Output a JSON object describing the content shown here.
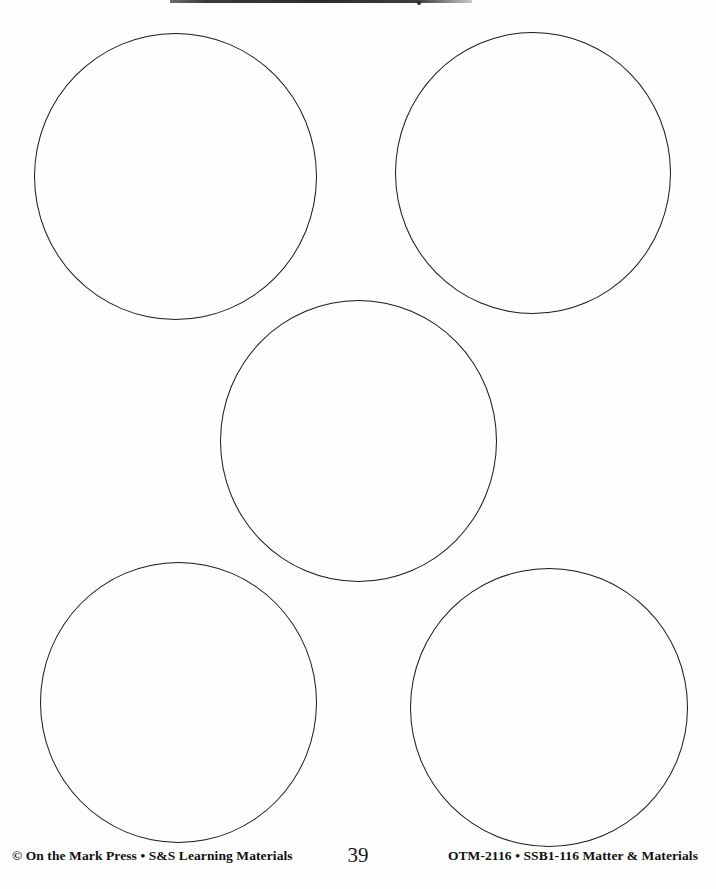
{
  "page": {
    "width": 716,
    "height": 889,
    "background_color": "#fefefe",
    "ink_color": "#1a1a1a",
    "document_type": "blank-worksheet"
  },
  "artifacts": {
    "top_scan_bar": {
      "name": "scan-edge-bar",
      "x": 170,
      "y": 0,
      "width": 302,
      "height": 3,
      "color": "#2c2c2c"
    }
  },
  "shapes": {
    "kind": "circle-outline",
    "stroke_color": "#1a1a1a",
    "stroke_width": 1.6,
    "fill": "none",
    "count": 5,
    "circles": [
      {
        "id": "circle-top-left",
        "label": "1",
        "x": 34,
        "y": 33,
        "width": 283,
        "height": 287
      },
      {
        "id": "circle-top-right",
        "label": "2",
        "x": 395,
        "y": 32,
        "width": 276,
        "height": 282
      },
      {
        "id": "circle-center",
        "label": "3",
        "x": 220,
        "y": 300,
        "width": 277,
        "height": 282
      },
      {
        "id": "circle-bottom-left",
        "label": "4",
        "x": 40,
        "y": 562,
        "width": 277,
        "height": 281
      },
      {
        "id": "circle-bottom-right",
        "label": "5",
        "x": 410,
        "y": 568,
        "width": 278,
        "height": 279
      }
    ]
  },
  "footer": {
    "copyright": "© On the Mark Press • S&S Learning Materials",
    "page_number": "39",
    "catalog_code": "OTM-2116 • SSB1-116 Matter & Materials"
  }
}
